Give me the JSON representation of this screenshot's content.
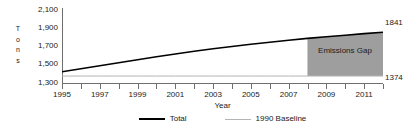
{
  "chart_data": {
    "type": "line",
    "title": "",
    "xlabel": "Year",
    "ylabel": "Tons",
    "ylabel_letters": [
      "T",
      "o",
      "n",
      "s"
    ],
    "ylim": [
      1300,
      2100
    ],
    "y_ticks": [
      2100,
      1900,
      1700,
      1500,
      1300
    ],
    "y_tick_labels": [
      "2,100",
      "1,900",
      "1,700",
      "1,500",
      "1,300"
    ],
    "xlim": [
      1995,
      2012
    ],
    "x_ticks": [
      1995,
      1996,
      1997,
      1998,
      1999,
      2000,
      2001,
      2002,
      2003,
      2004,
      2005,
      2006,
      2007,
      2008,
      2009,
      2010,
      2011,
      2012
    ],
    "x_tick_labels": [
      "1995",
      "",
      "1997",
      "",
      "1999",
      "",
      "2001",
      "",
      "2003",
      "",
      "2005",
      "",
      "2007",
      "",
      "2009",
      "",
      "2011",
      ""
    ],
    "grid": false,
    "legend_position": "bottom",
    "x": [
      1995,
      1996,
      1997,
      1998,
      1999,
      2000,
      2001,
      2002,
      2003,
      2004,
      2005,
      2006,
      2007,
      2008,
      2009,
      2010,
      2011,
      2012
    ],
    "series": [
      {
        "name": "Total",
        "color": "#000000",
        "values": [
          1420,
          1452,
          1484,
          1516,
          1548,
          1580,
          1610,
          1638,
          1665,
          1690,
          1713,
          1735,
          1756,
          1776,
          1794,
          1810,
          1827,
          1841
        ]
      },
      {
        "name": "1990 Baseline",
        "color": "#b4b4b4",
        "values": [
          1374,
          1374,
          1374,
          1374,
          1374,
          1374,
          1374,
          1374,
          1374,
          1374,
          1374,
          1374,
          1374,
          1374,
          1374,
          1374,
          1374,
          1374
        ]
      }
    ],
    "shaded_region": {
      "label": "Emissions Gap",
      "color": "#9e9e9e",
      "x_start": 2008,
      "x_end": 2012,
      "lower_series": "1990 Baseline",
      "upper_series": "Total"
    },
    "annotations": [
      {
        "text": "1841",
        "series": "Total",
        "x": 2012,
        "y": 1841
      },
      {
        "text": "1374",
        "series": "1990 Baseline",
        "x": 2012,
        "y": 1374
      }
    ]
  },
  "legend": {
    "items": [
      {
        "label": "Total"
      },
      {
        "label": "1990 Baseline"
      }
    ]
  }
}
